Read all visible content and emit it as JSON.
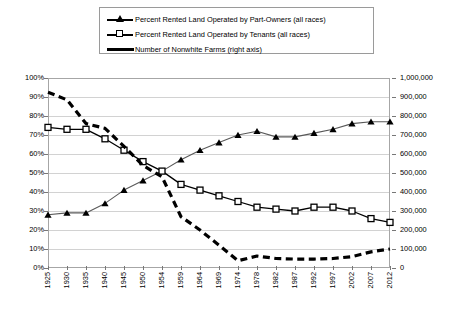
{
  "legend": {
    "position": "top-center",
    "items": [
      {
        "key": "triangle-line",
        "label": "Percent Rented Land Operated by Part-Owners (all races)"
      },
      {
        "key": "square-line",
        "label": "Percent Rented Land Operated by Tenants (all races)"
      },
      {
        "key": "dashed-line",
        "label": "Number of Nonwhite Farms (right axis)"
      }
    ]
  },
  "axes": {
    "left": {
      "ticks": [
        "0%",
        "10%",
        "20%",
        "30%",
        "40%",
        "50%",
        "60%",
        "70%",
        "80%",
        "90%",
        "100%"
      ],
      "min": 0,
      "max": 100
    },
    "right": {
      "ticks": [
        "0",
        "100,000",
        "200,000",
        "300,000",
        "400,000",
        "500,000",
        "600,000",
        "700,000",
        "800,000",
        "900,000",
        "1,000,000"
      ],
      "min": 0,
      "max": 1000000
    },
    "x": {
      "ticks": [
        "1925",
        "1930",
        "1935",
        "1940",
        "1945",
        "1950",
        "1954",
        "1959",
        "1964",
        "1969",
        "1974",
        "1978",
        "1982",
        "1987",
        "1992",
        "1997",
        "2002",
        "2007",
        "2012"
      ]
    }
  },
  "colors": {
    "line": "#000000",
    "part_owners_line": "#595959",
    "grid": "#d2d2d2",
    "frame": "#a6a6a6",
    "background": "#ffffff"
  },
  "chart_data": {
    "type": "line",
    "title": "",
    "xlabel": "",
    "ylabel": "",
    "grid": true,
    "legend_position": "top",
    "categories": [
      "1925",
      "1930",
      "1935",
      "1940",
      "1945",
      "1950",
      "1954",
      "1959",
      "1964",
      "1969",
      "1974",
      "1978",
      "1982",
      "1987",
      "1992",
      "1997",
      "2002",
      "2007",
      "2012"
    ],
    "ylim": [
      0,
      100
    ],
    "y2lim": [
      0,
      1000000
    ],
    "series": [
      {
        "name": "Percent Rented Land Operated by Part-Owners (all races)",
        "axis": "left",
        "unit": "percent",
        "marker": "triangle",
        "values": [
          28,
          29,
          29,
          34,
          41,
          46,
          51,
          57,
          62,
          66,
          70,
          72,
          69,
          69,
          71,
          73,
          76,
          77,
          77
        ]
      },
      {
        "name": "Percent Rented Land Operated by Tenants (all races)",
        "axis": "left",
        "unit": "percent",
        "marker": "square",
        "values": [
          74,
          73,
          73,
          68,
          62,
          56,
          51,
          44,
          41,
          38,
          35,
          32,
          31,
          30,
          32,
          32,
          30,
          26,
          24
        ]
      },
      {
        "name": "Number of Nonwhite Farms (right axis)",
        "axis": "right",
        "unit": "farms",
        "marker": "none",
        "style": "dashed",
        "values": [
          925000,
          885000,
          760000,
          735000,
          640000,
          540000,
          480000,
          270000,
          200000,
          120000,
          38000,
          63000,
          50000,
          47000,
          47000,
          50000,
          60000,
          85000,
          100000
        ]
      }
    ]
  }
}
